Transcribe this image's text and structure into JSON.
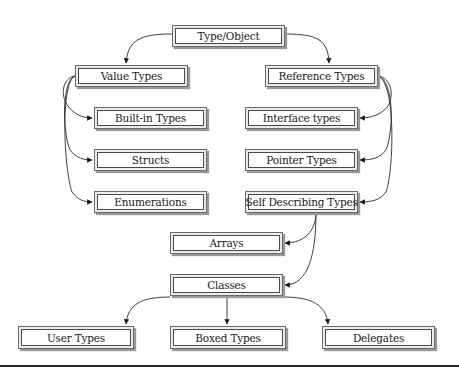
{
  "diagram": {
    "nodes": {
      "type_object": "Type/Object",
      "value_types": "Value Types",
      "reference_types": "Reference Types",
      "builtin_types": "Built-in Types",
      "structs": "Structs",
      "enumerations": "Enumerations",
      "interface_types": "Interface types",
      "pointer_types": "Pointer Types",
      "self_describing_types": "Self Describing Types",
      "arrays": "Arrays",
      "classes": "Classes",
      "user_types": "User Types",
      "boxed_types": "Boxed Types",
      "delegates": "Delegates"
    },
    "edges": [
      {
        "from": "Type/Object",
        "to": "Value Types"
      },
      {
        "from": "Type/Object",
        "to": "Reference Types"
      },
      {
        "from": "Value Types",
        "to": "Built-in Types"
      },
      {
        "from": "Value Types",
        "to": "Structs"
      },
      {
        "from": "Value Types",
        "to": "Enumerations"
      },
      {
        "from": "Reference Types",
        "to": "Interface types"
      },
      {
        "from": "Reference Types",
        "to": "Pointer Types"
      },
      {
        "from": "Reference Types",
        "to": "Self Describing Types"
      },
      {
        "from": "Self Describing Types",
        "to": "Arrays"
      },
      {
        "from": "Self Describing Types",
        "to": "Classes"
      },
      {
        "from": "Classes",
        "to": "User Types"
      },
      {
        "from": "Classes",
        "to": "Boxed Types"
      },
      {
        "from": "Classes",
        "to": "Delegates"
      }
    ],
    "colors": {
      "stroke": "#2a2a2a",
      "box_frame": "#ececec",
      "box_fill": "#ffffff"
    }
  }
}
